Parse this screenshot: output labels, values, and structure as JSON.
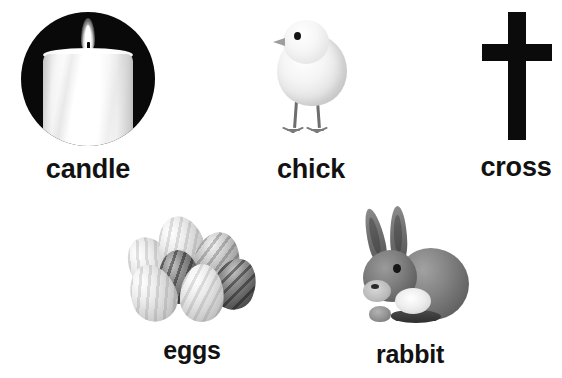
{
  "sheet": {
    "title": "Easter picture vocabulary cards",
    "background_color": "#ffffff",
    "label_color": "#121212"
  },
  "cards": [
    {
      "id": "candle",
      "label": "candle",
      "icon": "candle-icon",
      "description": "White lit candle with flame on a black circle",
      "row": 1,
      "column": 1
    },
    {
      "id": "chick",
      "label": "chick",
      "icon": "chick-icon",
      "description": "Fluffy pale baby chick standing, facing left",
      "row": 1,
      "column": 2
    },
    {
      "id": "cross",
      "label": "cross",
      "icon": "cross-icon",
      "description": "Solid black Latin cross",
      "row": 1,
      "column": 3
    },
    {
      "id": "eggs",
      "label": "eggs",
      "icon": "eggs-icon",
      "description": "Cluster of seven striped grayscale eggs",
      "row": 2,
      "column": 1
    },
    {
      "id": "rabbit",
      "label": "rabbit",
      "icon": "rabbit-icon",
      "description": "Gray rabbit sitting with upright ears, facing left",
      "row": 2,
      "column": 2
    }
  ]
}
